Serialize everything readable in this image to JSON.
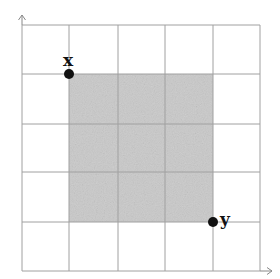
{
  "diagram": {
    "type": "grid-with-shaded-square",
    "grid": {
      "columns": 5,
      "rows": 5,
      "line_color": "#9a9a9a",
      "x_lines": [
        22,
        69,
        118,
        165,
        213,
        260
      ],
      "y_lines": [
        25,
        74,
        124,
        172,
        222,
        271
      ]
    },
    "axes": {
      "x_arrow": "right",
      "y_arrow": "up"
    },
    "shaded_region": {
      "x_from": 1,
      "x_to": 4,
      "y_from": 1,
      "y_to": 4,
      "color": "#c8c8c8"
    },
    "points": [
      {
        "label": "x",
        "grid_col": 1,
        "grid_row": 1
      },
      {
        "label": "y",
        "grid_col": 4,
        "grid_row": 4
      }
    ]
  }
}
